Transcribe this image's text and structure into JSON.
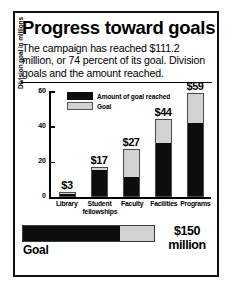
{
  "title": "Progress toward goals",
  "subtitle": "The campaign has reached $111.2 million, or 74 percent of its goal. Division goals and the amount reached.",
  "legend": {
    "reached_label": "Amount of goal reached",
    "goal_label": "Goal"
  },
  "axis": {
    "ylabel": "Division goal in millions",
    "ticks": [
      "0",
      "20",
      "40",
      "60"
    ]
  },
  "total": {
    "goal_label": "Goal",
    "amount_line1": "$150",
    "amount_line2": "million",
    "percent_reached": 74
  },
  "colors": {
    "reached": "#0d0d0d",
    "goal": "#d2d2d2",
    "border": "#111111",
    "background": "#ffffff"
  },
  "chart_data": {
    "type": "bar",
    "title": "Progress toward goals",
    "subtitle": "The campaign has reached $111.2 million, or 74 percent of its goal. Division goals and the amount reached.",
    "xlabel": "",
    "ylabel": "Division goal in millions",
    "ylim": [
      0,
      60
    ],
    "yticks": [
      0,
      20,
      40,
      60
    ],
    "grid": false,
    "legend_position": "top-left-inside",
    "stacked": true,
    "categories": [
      "Library",
      "Student fellowships",
      "Faculty",
      "Facilities",
      "Programs"
    ],
    "category_labels": [
      {
        "line1": "Library",
        "line2": ""
      },
      {
        "line1": "Student",
        "line2": "fellowships"
      },
      {
        "line1": "Faculty",
        "line2": ""
      },
      {
        "line1": "Facilities",
        "line2": ""
      },
      {
        "line1": "Programs",
        "line2": ""
      }
    ],
    "series": [
      {
        "name": "Goal",
        "values": [
          3,
          17,
          27,
          44,
          59
        ]
      },
      {
        "name": "Amount of goal reached",
        "values": [
          1.5,
          16,
          11,
          31,
          42
        ]
      }
    ],
    "data_labels": [
      "$3",
      "$17",
      "$27",
      "$44",
      "$59"
    ],
    "totals": {
      "goal": 150,
      "reached": 111.2,
      "percent": 74
    }
  }
}
